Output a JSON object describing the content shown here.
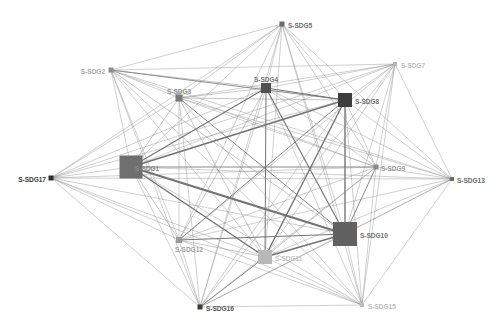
{
  "diagram": {
    "type": "network",
    "nodes": [
      {
        "id": "S-SDG1",
        "label": "S-SDG1",
        "x": 131,
        "y": 167,
        "size": 23,
        "color": "#6f6f6f",
        "label_color": "#8a8a8a",
        "label_dx": 4,
        "label_dy": 2,
        "anchor": "start"
      },
      {
        "id": "S-SDG2",
        "label": "S-SDG2",
        "x": 111,
        "y": 70,
        "size": 5,
        "color": "#8c8c8c",
        "label_color": "#a9a9a9",
        "label_dx": -6,
        "label_dy": 2,
        "anchor": "end"
      },
      {
        "id": "S-SDG3",
        "label": "S-SDG3",
        "x": 179,
        "y": 98,
        "size": 7,
        "color": "#7a7a7a",
        "label_color": "#8f8f8f",
        "label_dx": 0,
        "label_dy": -6,
        "anchor": "middle"
      },
      {
        "id": "S-SDG4",
        "label": "S-SDG4",
        "x": 266,
        "y": 88,
        "size": 10,
        "color": "#505050",
        "label_color": "#707070",
        "label_dx": 0,
        "label_dy": -8,
        "anchor": "middle"
      },
      {
        "id": "S-SDG5",
        "label": "S-SDG5",
        "x": 282,
        "y": 24,
        "size": 5,
        "color": "#6a6a6a",
        "label_color": "#6a6a6a",
        "label_dx": 6,
        "label_dy": 2,
        "anchor": "start"
      },
      {
        "id": "S-SDG7",
        "label": "S-SDG7",
        "x": 395,
        "y": 64,
        "size": 4,
        "color": "#b5b5b5",
        "label_color": "#bcbcbc",
        "label_dx": 6,
        "label_dy": 2,
        "anchor": "start"
      },
      {
        "id": "S-SDG8",
        "label": "S-SDG8",
        "x": 345,
        "y": 100,
        "size": 14,
        "color": "#3d3d3d",
        "label_color": "#707070",
        "label_dx": 10,
        "label_dy": 2,
        "anchor": "start"
      },
      {
        "id": "S-SDG9",
        "label": "S-SDG9",
        "x": 376,
        "y": 167,
        "size": 5,
        "color": "#8a8a8a",
        "label_color": "#9a9a9a",
        "label_dx": 5,
        "label_dy": 2,
        "anchor": "start"
      },
      {
        "id": "S-SDG10",
        "label": "S-SDG10",
        "x": 345,
        "y": 234,
        "size": 24,
        "color": "#616161",
        "label_color": "#707070",
        "label_dx": 15,
        "label_dy": 2,
        "anchor": "start"
      },
      {
        "id": "S-SDG11",
        "label": "S-SDG11",
        "x": 265,
        "y": 257,
        "size": 14,
        "color": "#b9b9b9",
        "label_color": "#c4c4c4",
        "label_dx": 10,
        "label_dy": 2,
        "anchor": "start"
      },
      {
        "id": "S-SDG12",
        "label": "S-SDG12",
        "x": 179,
        "y": 240,
        "size": 6,
        "color": "#9a9a9a",
        "label_color": "#a2a2a2",
        "label_dx": 10,
        "label_dy": 10,
        "anchor": "middle"
      },
      {
        "id": "S-SDG13",
        "label": "S-SDG13",
        "x": 452,
        "y": 179,
        "size": 4,
        "color": "#6a6a6a",
        "label_color": "#6a6a6a",
        "label_dx": 5,
        "label_dy": 2,
        "anchor": "start"
      },
      {
        "id": "S-SDG15",
        "label": "S-SDG15",
        "x": 362,
        "y": 305,
        "size": 4,
        "color": "#bdbdbd",
        "label_color": "#bcbcbc",
        "label_dx": 6,
        "label_dy": 2,
        "anchor": "start"
      },
      {
        "id": "S-SDG16",
        "label": "S-SDG16",
        "x": 200,
        "y": 307,
        "size": 5,
        "color": "#3c3c3c",
        "label_color": "#555555",
        "label_dx": 6,
        "label_dy": 2,
        "anchor": "start"
      },
      {
        "id": "S-SDG17",
        "label": "S-SDG17",
        "x": 51,
        "y": 178,
        "size": 5,
        "color": "#2e2e2e",
        "label_color": "#3a3a3a",
        "label_dx": -5,
        "label_dy": 2,
        "anchor": "end"
      }
    ],
    "edges": [
      {
        "source": "S-SDG1",
        "target": "S-SDG10",
        "weight": 4
      },
      {
        "source": "S-SDG1",
        "target": "S-SDG8",
        "weight": 3
      },
      {
        "source": "S-SDG1",
        "target": "S-SDG11",
        "weight": 2.5
      },
      {
        "source": "S-SDG1",
        "target": "S-SDG4",
        "weight": 2
      },
      {
        "source": "S-SDG1",
        "target": "S-SDG9",
        "weight": 1.5
      },
      {
        "source": "S-SDG1",
        "target": "S-SDG3",
        "weight": 1.2
      },
      {
        "source": "S-SDG1",
        "target": "S-SDG2",
        "weight": 1
      },
      {
        "source": "S-SDG1",
        "target": "S-SDG5",
        "weight": 1
      },
      {
        "source": "S-SDG1",
        "target": "S-SDG7",
        "weight": 1
      },
      {
        "source": "S-SDG1",
        "target": "S-SDG12",
        "weight": 1.2
      },
      {
        "source": "S-SDG1",
        "target": "S-SDG13",
        "weight": 1
      },
      {
        "source": "S-SDG1",
        "target": "S-SDG15",
        "weight": 1
      },
      {
        "source": "S-SDG1",
        "target": "S-SDG16",
        "weight": 1
      },
      {
        "source": "S-SDG1",
        "target": "S-SDG17",
        "weight": 1
      },
      {
        "source": "S-SDG8",
        "target": "S-SDG10",
        "weight": 2.5
      },
      {
        "source": "S-SDG8",
        "target": "S-SDG11",
        "weight": 2.5
      },
      {
        "source": "S-SDG8",
        "target": "S-SDG4",
        "weight": 2
      },
      {
        "source": "S-SDG8",
        "target": "S-SDG12",
        "weight": 1.5
      },
      {
        "source": "S-SDG8",
        "target": "S-SDG3",
        "weight": 1.2
      },
      {
        "source": "S-SDG8",
        "target": "S-SDG2",
        "weight": 1.5
      },
      {
        "source": "S-SDG8",
        "target": "S-SDG5",
        "weight": 1
      },
      {
        "source": "S-SDG8",
        "target": "S-SDG7",
        "weight": 1
      },
      {
        "source": "S-SDG8",
        "target": "S-SDG9",
        "weight": 1
      },
      {
        "source": "S-SDG8",
        "target": "S-SDG13",
        "weight": 1
      },
      {
        "source": "S-SDG8",
        "target": "S-SDG15",
        "weight": 1
      },
      {
        "source": "S-SDG8",
        "target": "S-SDG16",
        "weight": 1
      },
      {
        "source": "S-SDG8",
        "target": "S-SDG17",
        "weight": 1
      },
      {
        "source": "S-SDG10",
        "target": "S-SDG11",
        "weight": 2.5
      },
      {
        "source": "S-SDG10",
        "target": "S-SDG12",
        "weight": 1.8
      },
      {
        "source": "S-SDG10",
        "target": "S-SDG4",
        "weight": 2
      },
      {
        "source": "S-SDG10",
        "target": "S-SDG3",
        "weight": 1.5
      },
      {
        "source": "S-SDG10",
        "target": "S-SDG2",
        "weight": 1.2
      },
      {
        "source": "S-SDG10",
        "target": "S-SDG5",
        "weight": 1
      },
      {
        "source": "S-SDG10",
        "target": "S-SDG7",
        "weight": 1
      },
      {
        "source": "S-SDG10",
        "target": "S-SDG9",
        "weight": 1.5
      },
      {
        "source": "S-SDG10",
        "target": "S-SDG13",
        "weight": 1
      },
      {
        "source": "S-SDG10",
        "target": "S-SDG15",
        "weight": 1
      },
      {
        "source": "S-SDG10",
        "target": "S-SDG16",
        "weight": 1.2
      },
      {
        "source": "S-SDG10",
        "target": "S-SDG17",
        "weight": 1
      },
      {
        "source": "S-SDG4",
        "target": "S-SDG11",
        "weight": 1.8
      },
      {
        "source": "S-SDG4",
        "target": "S-SDG3",
        "weight": 1.2
      },
      {
        "source": "S-SDG4",
        "target": "S-SDG2",
        "weight": 1.2
      },
      {
        "source": "S-SDG4",
        "target": "S-SDG5",
        "weight": 1
      },
      {
        "source": "S-SDG4",
        "target": "S-SDG12",
        "weight": 1.2
      },
      {
        "source": "S-SDG4",
        "target": "S-SDG9",
        "weight": 1
      },
      {
        "source": "S-SDG4",
        "target": "S-SDG16",
        "weight": 1
      },
      {
        "source": "S-SDG4",
        "target": "S-SDG17",
        "weight": 1
      },
      {
        "source": "S-SDG4",
        "target": "S-SDG7",
        "weight": 1
      },
      {
        "source": "S-SDG4",
        "target": "S-SDG13",
        "weight": 1
      },
      {
        "source": "S-SDG4",
        "target": "S-SDG15",
        "weight": 1
      },
      {
        "source": "S-SDG3",
        "target": "S-SDG11",
        "weight": 1.2
      },
      {
        "source": "S-SDG3",
        "target": "S-SDG2",
        "weight": 1
      },
      {
        "source": "S-SDG3",
        "target": "S-SDG9",
        "weight": 1
      },
      {
        "source": "S-SDG3",
        "target": "S-SDG12",
        "weight": 1
      },
      {
        "source": "S-SDG3",
        "target": "S-SDG5",
        "weight": 1
      },
      {
        "source": "S-SDG3",
        "target": "S-SDG16",
        "weight": 1
      },
      {
        "source": "S-SDG3",
        "target": "S-SDG13",
        "weight": 1
      },
      {
        "source": "S-SDG3",
        "target": "S-SDG17",
        "weight": 1
      },
      {
        "source": "S-SDG3",
        "target": "S-SDG15",
        "weight": 1
      },
      {
        "source": "S-SDG3",
        "target": "S-SDG7",
        "weight": 1
      },
      {
        "source": "S-SDG11",
        "target": "S-SDG12",
        "weight": 1.2
      },
      {
        "source": "S-SDG11",
        "target": "S-SDG16",
        "weight": 1.5
      },
      {
        "source": "S-SDG11",
        "target": "S-SDG9",
        "weight": 1.2
      },
      {
        "source": "S-SDG11",
        "target": "S-SDG2",
        "weight": 1
      },
      {
        "source": "S-SDG11",
        "target": "S-SDG5",
        "weight": 1
      },
      {
        "source": "S-SDG11",
        "target": "S-SDG7",
        "weight": 1
      },
      {
        "source": "S-SDG11",
        "target": "S-SDG13",
        "weight": 1
      },
      {
        "source": "S-SDG11",
        "target": "S-SDG15",
        "weight": 1
      },
      {
        "source": "S-SDG11",
        "target": "S-SDG17",
        "weight": 1
      },
      {
        "source": "S-SDG2",
        "target": "S-SDG5",
        "weight": 1
      },
      {
        "source": "S-SDG2",
        "target": "S-SDG7",
        "weight": 1
      },
      {
        "source": "S-SDG2",
        "target": "S-SDG9",
        "weight": 1
      },
      {
        "source": "S-SDG2",
        "target": "S-SDG12",
        "weight": 1
      },
      {
        "source": "S-SDG2",
        "target": "S-SDG16",
        "weight": 1
      },
      {
        "source": "S-SDG2",
        "target": "S-SDG15",
        "weight": 1
      },
      {
        "source": "S-SDG2",
        "target": "S-SDG13",
        "weight": 1
      },
      {
        "source": "S-SDG5",
        "target": "S-SDG9",
        "weight": 1
      },
      {
        "source": "S-SDG5",
        "target": "S-SDG12",
        "weight": 1
      },
      {
        "source": "S-SDG5",
        "target": "S-SDG16",
        "weight": 1
      },
      {
        "source": "S-SDG5",
        "target": "S-SDG17",
        "weight": 1
      },
      {
        "source": "S-SDG5",
        "target": "S-SDG13",
        "weight": 1
      },
      {
        "source": "S-SDG5",
        "target": "S-SDG15",
        "weight": 1
      },
      {
        "source": "S-SDG7",
        "target": "S-SDG9",
        "weight": 1
      },
      {
        "source": "S-SDG7",
        "target": "S-SDG12",
        "weight": 1
      },
      {
        "source": "S-SDG7",
        "target": "S-SDG13",
        "weight": 1
      },
      {
        "source": "S-SDG7",
        "target": "S-SDG15",
        "weight": 1
      },
      {
        "source": "S-SDG7",
        "target": "S-SDG16",
        "weight": 1
      },
      {
        "source": "S-SDG7",
        "target": "S-SDG17",
        "weight": 1
      },
      {
        "source": "S-SDG9",
        "target": "S-SDG12",
        "weight": 1
      },
      {
        "source": "S-SDG9",
        "target": "S-SDG13",
        "weight": 1
      },
      {
        "source": "S-SDG9",
        "target": "S-SDG16",
        "weight": 1
      },
      {
        "source": "S-SDG9",
        "target": "S-SDG17",
        "weight": 1
      },
      {
        "source": "S-SDG9",
        "target": "S-SDG15",
        "weight": 1
      },
      {
        "source": "S-SDG12",
        "target": "S-SDG16",
        "weight": 1
      },
      {
        "source": "S-SDG12",
        "target": "S-SDG13",
        "weight": 1
      },
      {
        "source": "S-SDG12",
        "target": "S-SDG17",
        "weight": 1
      },
      {
        "source": "S-SDG12",
        "target": "S-SDG15",
        "weight": 1
      },
      {
        "source": "S-SDG13",
        "target": "S-SDG16",
        "weight": 1
      },
      {
        "source": "S-SDG13",
        "target": "S-SDG17",
        "weight": 1
      },
      {
        "source": "S-SDG13",
        "target": "S-SDG15",
        "weight": 1
      },
      {
        "source": "S-SDG15",
        "target": "S-SDG16",
        "weight": 1
      },
      {
        "source": "S-SDG15",
        "target": "S-SDG17",
        "weight": 1
      },
      {
        "source": "S-SDG16",
        "target": "S-SDG17",
        "weight": 1
      }
    ],
    "style": {
      "background": "#ffffff",
      "edge_color": "#8c8c8c",
      "heavy_edge_color": "#6a6a6a"
    }
  }
}
